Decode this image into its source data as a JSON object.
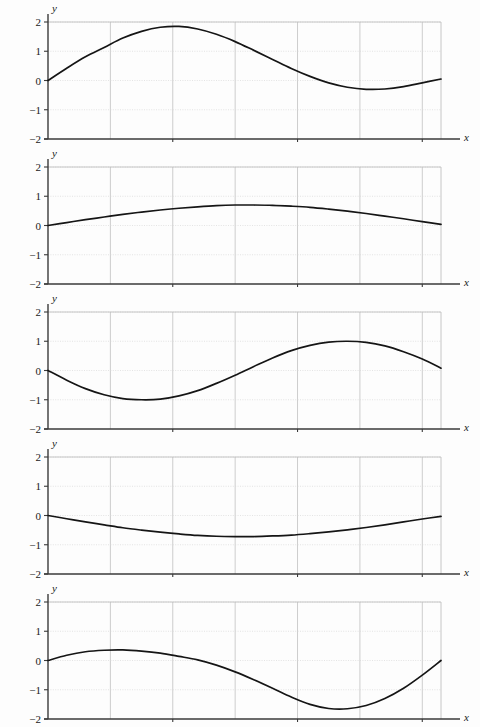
{
  "figure": {
    "kind": "multi-panel-line-plots",
    "panel_count": 5,
    "panel_width_px": 480,
    "panel_height_px": 145
  },
  "axes": {
    "x_label": "x",
    "y_label": "y",
    "x_ticks": [
      {
        "value": 1,
        "label": "1"
      },
      {
        "value": 2,
        "label": "2"
      },
      {
        "value": 3,
        "label": "3"
      }
    ],
    "y_ticks": [
      {
        "value": 2,
        "label": "2"
      },
      {
        "value": 1,
        "label": "1"
      },
      {
        "value": 0,
        "label": "0"
      },
      {
        "value": -1,
        "label": "−1"
      },
      {
        "value": -2,
        "label": "−2"
      }
    ],
    "x_gridlines": [
      0.5,
      1.0,
      1.5,
      2.0,
      2.5,
      3.0
    ],
    "y_gridlines": [
      2,
      1,
      0,
      -1
    ],
    "xlim": [
      0,
      3.15
    ],
    "ylim": [
      -2,
      2
    ]
  },
  "colors": {
    "background": "#fdfdfd",
    "curve": "#151515",
    "axis": "#3a3a3a",
    "grid_major": "#b8b8b8",
    "grid_minor": "#d9d9d9",
    "tick_text": "#1a1a1a"
  },
  "chart_data": [
    {
      "type": "line",
      "panel_index": 1,
      "title": "",
      "xlabel": "x",
      "ylabel": "y",
      "xlim": [
        0,
        3.15
      ],
      "ylim": [
        -2,
        2
      ],
      "grid": true,
      "legend": "none",
      "description": "Rises from 0 to a maximum near 1.85 at x≈0.95, falls through 0 near x≈2.1, shallow minimum near −0.30 at x≈2.55, returns to about 0.05 at x≈π",
      "x": [
        0,
        0.15,
        0.3,
        0.45,
        0.6,
        0.75,
        0.9,
        1.05,
        1.2,
        1.35,
        1.5,
        1.65,
        1.8,
        1.95,
        2.1,
        2.25,
        2.4,
        2.55,
        2.7,
        2.85,
        3.0,
        3.15
      ],
      "y": [
        0,
        0.42,
        0.81,
        1.13,
        1.45,
        1.68,
        1.82,
        1.85,
        1.76,
        1.58,
        1.33,
        1.03,
        0.72,
        0.41,
        0.14,
        -0.08,
        -0.23,
        -0.3,
        -0.29,
        -0.21,
        -0.08,
        0.05
      ]
    },
    {
      "type": "line",
      "panel_index": 2,
      "title": "",
      "xlabel": "x",
      "ylabel": "y",
      "xlim": [
        0,
        3.15
      ],
      "ylim": [
        -2,
        2
      ],
      "grid": true,
      "legend": "none",
      "description": "Low shallow hump: rises from 0 to a broad maximum near 0.70 at x≈1.6 and returns to about 0.05 at x≈π",
      "x": [
        0,
        0.15,
        0.3,
        0.45,
        0.6,
        0.75,
        0.9,
        1.05,
        1.2,
        1.35,
        1.5,
        1.65,
        1.8,
        1.95,
        2.1,
        2.25,
        2.4,
        2.55,
        2.7,
        2.85,
        3.0,
        3.15
      ],
      "y": [
        0,
        0.1,
        0.2,
        0.29,
        0.38,
        0.46,
        0.53,
        0.59,
        0.64,
        0.68,
        0.7,
        0.7,
        0.69,
        0.66,
        0.62,
        0.56,
        0.49,
        0.41,
        0.32,
        0.23,
        0.13,
        0.04
      ]
    },
    {
      "type": "line",
      "panel_index": 3,
      "title": "",
      "xlabel": "x",
      "ylabel": "y",
      "xlim": [
        0,
        3.15
      ],
      "ylim": [
        -2,
        2
      ],
      "grid": true,
      "legend": "none",
      "description": "Starts at 0, dips to a minimum of about −1.00 at x≈0.78, crosses zero near x≈1.57, rises to a maximum of about 1.00 at x≈2.40, and returns to about 0.08 at x≈π",
      "x": [
        0,
        0.15,
        0.3,
        0.45,
        0.6,
        0.75,
        0.9,
        1.05,
        1.2,
        1.35,
        1.5,
        1.65,
        1.8,
        1.95,
        2.1,
        2.25,
        2.4,
        2.55,
        2.7,
        2.85,
        3.0,
        3.15
      ],
      "y": [
        0,
        -0.33,
        -0.62,
        -0.83,
        -0.96,
        -1.0,
        -0.98,
        -0.87,
        -0.69,
        -0.44,
        -0.16,
        0.14,
        0.43,
        0.68,
        0.86,
        0.97,
        1.0,
        0.96,
        0.84,
        0.64,
        0.39,
        0.08
      ]
    },
    {
      "type": "line",
      "panel_index": 4,
      "title": "",
      "xlabel": "x",
      "ylabel": "y",
      "xlim": [
        0,
        3.15
      ],
      "ylim": [
        -2,
        2
      ],
      "grid": true,
      "legend": "none",
      "description": "Shallow trough: descends from 0 to a broad minimum near −0.72 at x≈1.6 and rises back to about 0.05 at x≈π",
      "x": [
        0,
        0.15,
        0.3,
        0.45,
        0.6,
        0.75,
        0.9,
        1.05,
        1.2,
        1.35,
        1.5,
        1.65,
        1.8,
        1.95,
        2.1,
        2.25,
        2.4,
        2.55,
        2.7,
        2.85,
        3.0,
        3.15
      ],
      "y": [
        0,
        -0.11,
        -0.22,
        -0.32,
        -0.42,
        -0.5,
        -0.57,
        -0.63,
        -0.68,
        -0.71,
        -0.72,
        -0.72,
        -0.7,
        -0.67,
        -0.62,
        -0.56,
        -0.49,
        -0.41,
        -0.32,
        -0.22,
        -0.12,
        -0.03
      ]
    },
    {
      "type": "line",
      "panel_index": 5,
      "title": "",
      "xlabel": "x",
      "ylabel": "y",
      "xlim": [
        0,
        3.15
      ],
      "ylim": [
        -2,
        2
      ],
      "grid": true,
      "legend": "none",
      "description": "Starts at 0, rises to a small maximum of about 0.36 at x≈0.60, crosses zero near x≈1.25, falls to a deep minimum of about −1.65 at x≈2.20, and rises back to about 0.00 at x≈π",
      "x": [
        0,
        0.15,
        0.3,
        0.45,
        0.6,
        0.75,
        0.9,
        1.05,
        1.2,
        1.35,
        1.5,
        1.65,
        1.8,
        1.95,
        2.1,
        2.25,
        2.4,
        2.55,
        2.7,
        2.85,
        3.0,
        3.15
      ],
      "y": [
        0,
        0.18,
        0.3,
        0.35,
        0.36,
        0.32,
        0.25,
        0.14,
        0.02,
        -0.16,
        -0.39,
        -0.66,
        -0.95,
        -1.25,
        -1.5,
        -1.64,
        -1.65,
        -1.54,
        -1.3,
        -0.95,
        -0.5,
        0.0
      ]
    }
  ]
}
